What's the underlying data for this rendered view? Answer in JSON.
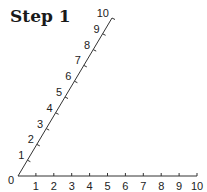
{
  "title": "Step 1",
  "diagram": {
    "origin_label": "0",
    "horizontal_axis": {
      "labels": [
        "1",
        "2",
        "3",
        "4",
        "5",
        "6",
        "7",
        "8",
        "9",
        "10"
      ]
    },
    "diagonal_axis": {
      "labels": [
        "1",
        "2",
        "3",
        "4",
        "5",
        "6",
        "7",
        "8",
        "9",
        "10"
      ]
    },
    "line_color": "#333333"
  }
}
